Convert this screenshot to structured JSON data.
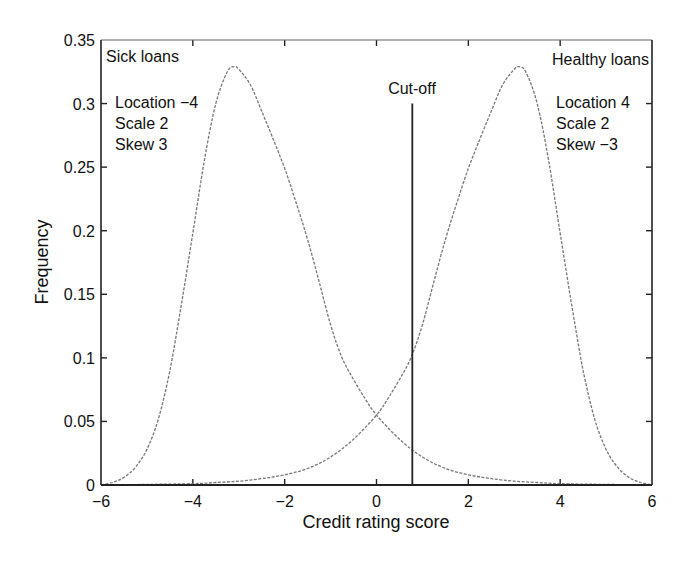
{
  "chart_data": {
    "type": "line",
    "title": "",
    "xlabel": "Credit rating score",
    "ylabel": "Frequency",
    "xlim": [
      -6,
      6
    ],
    "ylim": [
      0,
      0.35
    ],
    "xticks": [
      -6,
      -4,
      -2,
      0,
      2,
      4,
      6
    ],
    "xtick_labels": [
      "−6",
      "−4",
      "−2",
      "0",
      "2",
      "4",
      "6"
    ],
    "yticks": [
      0,
      0.05,
      0.1,
      0.15,
      0.2,
      0.25,
      0.3,
      0.35
    ],
    "ytick_labels": [
      "0",
      "0.05",
      "0.1",
      "0.15",
      "0.2",
      "0.25",
      "0.3",
      "0.35"
    ],
    "grid": false,
    "legend": null,
    "series": [
      {
        "name": "Sick loans",
        "params": {
          "location": -4,
          "scale": 2,
          "skew": 3
        },
        "x": [
          -6,
          -5.75,
          -5.5,
          -5.25,
          -5,
          -4.75,
          -4.5,
          -4.25,
          -4,
          -3.75,
          -3.5,
          -3.25,
          -3.1,
          -3,
          -2.75,
          -2.5,
          -2.25,
          -2,
          -1.75,
          -1.5,
          -1.25,
          -1,
          -0.75,
          -0.5,
          -0.25,
          0,
          0.5,
          1,
          1.5,
          2,
          2.5,
          3,
          3.5,
          4,
          5,
          6
        ],
        "y": [
          0.0,
          0.002,
          0.006,
          0.014,
          0.028,
          0.052,
          0.09,
          0.142,
          0.198,
          0.255,
          0.3,
          0.325,
          0.329,
          0.327,
          0.315,
          0.294,
          0.272,
          0.249,
          0.222,
          0.193,
          0.16,
          0.126,
          0.1,
          0.083,
          0.068,
          0.055,
          0.036,
          0.022,
          0.013,
          0.008,
          0.005,
          0.003,
          0.002,
          0.001,
          0.0005,
          0.0
        ]
      },
      {
        "name": "Healthy loans",
        "params": {
          "location": 4,
          "scale": 2,
          "skew": -3
        },
        "x": [
          -6,
          -5,
          -4,
          -3.5,
          -3,
          -2.5,
          -2,
          -1.5,
          -1,
          -0.5,
          0,
          0.25,
          0.5,
          0.75,
          1,
          1.25,
          1.5,
          1.75,
          2,
          2.25,
          2.5,
          2.75,
          3,
          3.1,
          3.25,
          3.5,
          3.75,
          4,
          4.25,
          4.5,
          4.75,
          5,
          5.25,
          5.5,
          5.75,
          6
        ],
        "y": [
          0.0,
          0.0005,
          0.001,
          0.002,
          0.003,
          0.005,
          0.008,
          0.013,
          0.022,
          0.036,
          0.055,
          0.068,
          0.083,
          0.1,
          0.126,
          0.16,
          0.193,
          0.222,
          0.249,
          0.272,
          0.294,
          0.315,
          0.327,
          0.329,
          0.325,
          0.3,
          0.255,
          0.198,
          0.142,
          0.09,
          0.052,
          0.028,
          0.014,
          0.006,
          0.002,
          0.0
        ]
      }
    ],
    "annotations": [
      {
        "text": "Sick loans",
        "x": -5.9,
        "y": 0.335
      },
      {
        "text": "Location −4",
        "x": -5.6,
        "y": 0.3
      },
      {
        "text": "Scale 2",
        "x": -5.5,
        "y": 0.285
      },
      {
        "text": "Skew 3",
        "x": -5.5,
        "y": 0.27
      },
      {
        "text": "Healthy loans",
        "x": 5.95,
        "y": 0.335
      },
      {
        "text": "Location 4",
        "x": 3.7,
        "y": 0.3
      },
      {
        "text": "Scale 2",
        "x": 3.7,
        "y": 0.285
      },
      {
        "text": "Skew −3",
        "x": 3.7,
        "y": 0.27
      },
      {
        "text": "Cut-off",
        "x": 0.78,
        "y": 0.31
      }
    ],
    "cutoff": {
      "label": "Cut-off",
      "x": 0.78,
      "y_top": 0.3
    }
  },
  "labels": {
    "xlabel": "Credit rating score",
    "ylabel": "Frequency",
    "sick_title": "Sick loans",
    "sick_location": "Location −4",
    "sick_scale": "Scale 2",
    "sick_skew": "Skew 3",
    "healthy_title": "Healthy loans",
    "healthy_location": "Location 4",
    "healthy_scale": "Scale 2",
    "healthy_skew": "Skew −3",
    "cutoff": "Cut-off"
  }
}
